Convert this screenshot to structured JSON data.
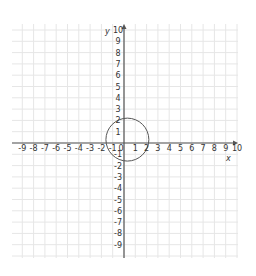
{
  "chart_data": {
    "type": "scatter",
    "title": "",
    "xlabel": "x",
    "ylabel": "y",
    "xlim": [
      -10,
      10
    ],
    "ylim": [
      -10,
      10
    ],
    "grid": true,
    "x_ticks": [
      "-9",
      "-8",
      "-7",
      "-6",
      "-5",
      "-4",
      "-3",
      "-2",
      "-1",
      "0",
      "1",
      "2",
      "3",
      "4",
      "5",
      "6",
      "7",
      "8",
      "9",
      "10"
    ],
    "y_ticks": [
      "10",
      "9",
      "8",
      "7",
      "6",
      "5",
      "4",
      "3",
      "2",
      "1",
      "-1",
      "-2",
      "-3",
      "-4",
      "-5",
      "-6",
      "-7",
      "-8",
      "-9"
    ],
    "shapes": [
      {
        "type": "circle",
        "center": [
          0.3,
          0.3
        ],
        "radius": 1.9,
        "color": "#555555"
      }
    ]
  },
  "colors": {
    "grid": "#e6e6e6",
    "axis": "#555555",
    "circle": "#555555",
    "text": "#333333"
  }
}
